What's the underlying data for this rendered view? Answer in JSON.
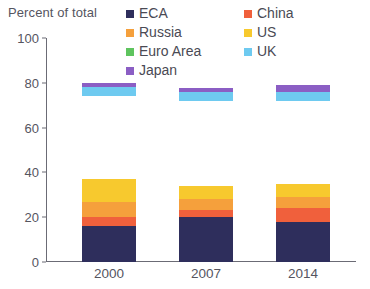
{
  "chart_data": {
    "type": "bar",
    "stacked": true,
    "title": "Percent of total",
    "xlabel": "",
    "ylabel": "Percent of total",
    "ylim": [
      0,
      100
    ],
    "yticks": [
      0,
      20,
      40,
      60,
      80,
      100
    ],
    "grid": false,
    "legend_position": "top-right",
    "categories": [
      "2000",
      "2007",
      "2014"
    ],
    "series": [
      {
        "name": "ECA",
        "color": "#2e2e5c",
        "values": [
          16,
          20,
          18
        ]
      },
      {
        "name": "China",
        "color": "#f0603c",
        "values": [
          4,
          3,
          6
        ]
      },
      {
        "name": "Russia",
        "color": "#f5a03c",
        "values": [
          7,
          5,
          5
        ]
      },
      {
        "name": "US",
        "color": "#f7c92e",
        "values": [
          10,
          6,
          6
        ]
      },
      {
        "name": "Euro Area",
        "color": "#5ec койка",
        "values": [
          37,
          38,
          37
        ]
      },
      {
        "name": "UK",
        "color": "#6ecaf0",
        "values": [
          4,
          4,
          4
        ]
      },
      {
        "name": "Japan",
        "color": "#8b5ec4",
        "values": [
          2,
          1.5,
          3
        ]
      }
    ],
    "totals": [
      80,
      77.5,
      79
    ]
  },
  "header": {
    "axis_title": "Percent of total"
  },
  "legend": {
    "items": [
      {
        "label": "ECA",
        "color": "#2e2e5c"
      },
      {
        "label": "China",
        "color": "#f0603c"
      },
      {
        "label": "Russia",
        "color": "#f5a03c"
      },
      {
        "label": "US",
        "color": "#f7c92e"
      },
      {
        "label": "Euro Area",
        "color": "#5ec45e"
      },
      {
        "label": "UK",
        "color": "#6ecaf0"
      },
      {
        "label": "Japan",
        "color": "#8b5ec4"
      }
    ]
  },
  "axes": {
    "y_ticks": [
      "0",
      "20",
      "40",
      "60",
      "80",
      "100"
    ],
    "x_ticks": [
      "2000",
      "2007",
      "2014"
    ]
  }
}
